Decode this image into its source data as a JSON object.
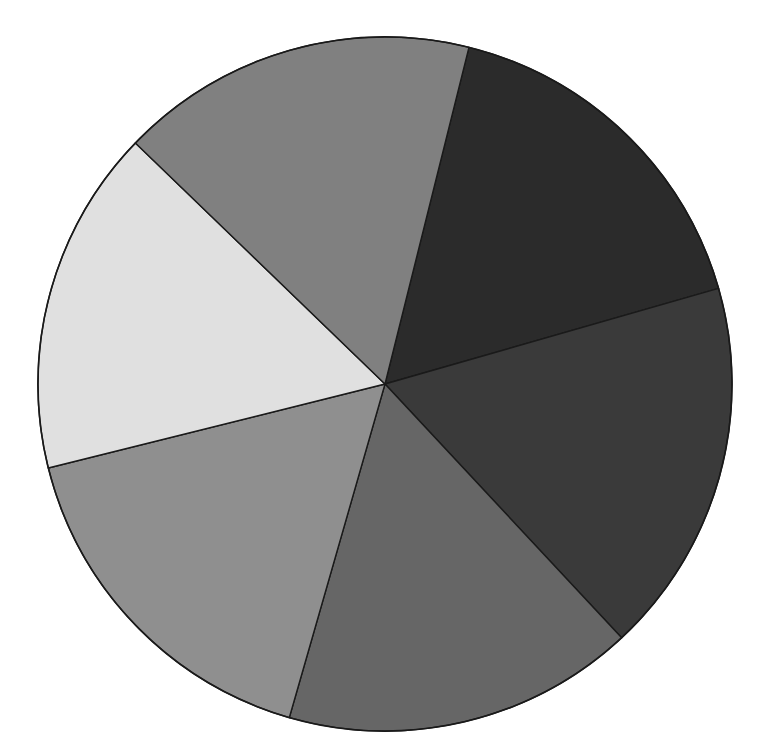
{
  "figure": {
    "background_color": "#ffffff",
    "width": 781,
    "height": 756
  },
  "chart_data": {
    "type": "pie",
    "title": "",
    "subtitle": "",
    "xlabel": "",
    "ylabel": "",
    "grid": false,
    "legend": "none",
    "labels_shown": false,
    "percent_labels_shown": false,
    "center_x": 385,
    "center_y": 384,
    "radius": 347,
    "start_angle_deg": 16,
    "direction": "counterclockwise",
    "edge_color": "#1a1a1a",
    "edge_width": 1.4,
    "categories": [
      "Slice 1",
      "Slice 2",
      "Slice 3",
      "Slice 4",
      "Slice 5",
      "Slice 6"
    ],
    "values": [
      60,
      60,
      59,
      60,
      58,
      63
    ],
    "percentages": [
      16.7,
      16.7,
      16.4,
      16.7,
      16.1,
      17.5
    ],
    "angles_deg": [
      60,
      60,
      59,
      60,
      58,
      63
    ],
    "colors": [
      "#2b2b2b",
      "#3a3a3a",
      "#666666",
      "#8f8f8f",
      "#e0e0e0",
      "#808080"
    ],
    "wedges": [
      {
        "name": "wedge-upper-right-darkest",
        "color": "#2b2b2b",
        "start_angle_deg": 16,
        "end_angle_deg": 76,
        "sweep_deg": 60,
        "percent": 16.7
      },
      {
        "name": "wedge-right-dark",
        "color": "#3a3a3a",
        "start_angle_deg": -47,
        "end_angle_deg": 16,
        "sweep_deg": 63,
        "percent": 17.5
      },
      {
        "name": "wedge-bottom-medium-dark",
        "color": "#666666",
        "start_angle_deg": -106,
        "end_angle_deg": -47,
        "sweep_deg": 59,
        "percent": 16.4
      },
      {
        "name": "wedge-bottom-left-gray",
        "color": "#8f8f8f",
        "start_angle_deg": -166,
        "end_angle_deg": -106,
        "sweep_deg": 60,
        "percent": 16.7
      },
      {
        "name": "wedge-left-lightest",
        "color": "#e0e0e0",
        "start_angle_deg": 136,
        "end_angle_deg": 194,
        "sweep_deg": 58,
        "percent": 16.1
      },
      {
        "name": "wedge-upper-left-medium",
        "color": "#808080",
        "start_angle_deg": 76,
        "end_angle_deg": 136,
        "sweep_deg": 60,
        "percent": 16.7
      }
    ]
  }
}
